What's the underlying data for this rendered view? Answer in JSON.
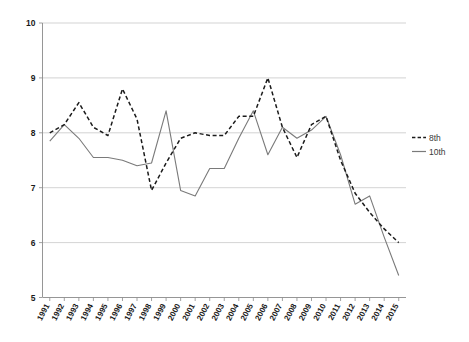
{
  "chart_data": {
    "type": "line",
    "title": "",
    "subtitle": "",
    "xlabel": "",
    "ylabel": "",
    "ylim": [
      5,
      10
    ],
    "yticks": [
      5,
      6,
      7,
      8,
      9,
      10
    ],
    "ytick_labels": [
      "5",
      "6",
      "7",
      "8",
      "9",
      "10"
    ],
    "grid": true,
    "legend_position": "right",
    "categories": [
      "1991",
      "1992",
      "1993",
      "1994",
      "1995",
      "1996",
      "1997",
      "1998",
      "1999",
      "2000",
      "2001",
      "2002",
      "2003",
      "2004",
      "2005",
      "2006",
      "2007",
      "2008",
      "2009",
      "2010",
      "2011",
      "2012",
      "2013",
      "2014",
      "2015"
    ],
    "series": [
      {
        "name": "8th",
        "style": "dashed",
        "color": "#1b1b1b",
        "values": [
          8.0,
          8.15,
          8.55,
          8.1,
          7.95,
          8.8,
          8.25,
          6.95,
          7.45,
          7.9,
          8.0,
          7.95,
          7.95,
          8.3,
          8.3,
          9.0,
          8.1,
          7.55,
          8.15,
          8.3,
          7.5,
          6.9,
          6.55,
          6.25,
          6.0
        ]
      },
      {
        "name": "10th",
        "style": "solid",
        "color": "#7a7a7a",
        "values": [
          7.85,
          8.15,
          7.9,
          7.55,
          7.55,
          7.5,
          7.4,
          7.45,
          8.4,
          6.95,
          6.85,
          7.35,
          7.35,
          7.9,
          8.4,
          7.6,
          8.1,
          7.9,
          8.05,
          8.3,
          7.6,
          6.7,
          6.85,
          6.1,
          5.4
        ]
      }
    ]
  },
  "legend": {
    "entries": [
      {
        "label": "8th"
      },
      {
        "label": "10th"
      }
    ]
  },
  "axes": {
    "y_min_label": "5",
    "y_max_label": "10"
  }
}
